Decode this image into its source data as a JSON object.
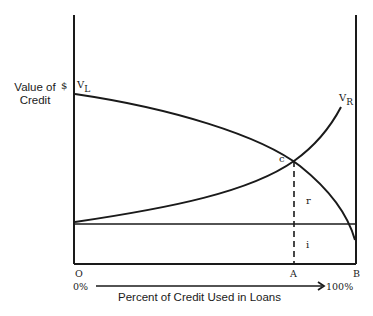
{
  "diagram": {
    "y_axis_label_line1": "Value of",
    "y_axis_label_line2": "Credit",
    "y_axis_unit": "$",
    "curves": {
      "vl_label_main": "V",
      "vl_label_sub": "L",
      "vr_label_main": "V",
      "vr_label_sub": "R"
    },
    "intersection_label": "c",
    "region_upper_label": "r",
    "region_lower_label": "i",
    "x_ticks": {
      "origin": "O",
      "a": "A",
      "b": "B"
    },
    "x_range_start": "0%",
    "x_range_end": "100%",
    "x_axis_title": "Percent of Credit Used in Loans",
    "colors": {
      "line": "#1a1a1a",
      "background": "#ffffff"
    }
  }
}
